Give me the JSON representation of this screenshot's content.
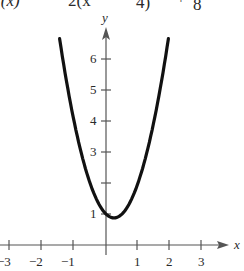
{
  "header": {
    "equation_left": "f(x)",
    "equation_eq": "=",
    "equation_mid": "2(x",
    "equation_frac_den": "4)",
    "equation_plus": "+",
    "equation_const_den": "8"
  },
  "chart_data": {
    "type": "line",
    "xlabel": "x",
    "ylabel": "y",
    "xlim": [
      -3.3,
      3.8
    ],
    "ylim": [
      -0.5,
      7
    ],
    "x_ticks": [
      -3,
      -2,
      -1,
      1,
      2,
      3
    ],
    "x_tick_labels": [
      "−3",
      "−2",
      "−1",
      "1",
      "2",
      "3"
    ],
    "y_ticks": [
      1,
      2,
      3,
      4,
      5,
      6
    ],
    "y_tick_labels": [
      "1",
      "",
      "3",
      "4",
      "5",
      "6"
    ],
    "grid": false,
    "series": [
      {
        "name": "f(x) = 2(x − 1/4)² + 7/8",
        "function": "2*(x-0.25)^2+0.875",
        "vertex": [
          0.25,
          0.875
        ],
        "x_range": [
          -1.45,
          1.95
        ],
        "x": [
          -1.45,
          -1.0,
          -0.5,
          0.0,
          0.25,
          0.5,
          1.0,
          1.5,
          1.95
        ],
        "y": [
          6.655,
          4.0,
          2.0,
          1.0,
          0.875,
          1.0,
          2.0,
          4.0,
          6.655
        ]
      }
    ]
  }
}
